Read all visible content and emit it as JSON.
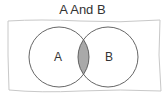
{
  "title": "A And B",
  "sets": [
    {
      "label": "A",
      "cx": 59,
      "cy": 57,
      "r": 30
    },
    {
      "label": "B",
      "cx": 108,
      "cy": 57,
      "r": 30
    }
  ],
  "intersection": {
    "label": "A and B",
    "fill": "#a9a9a9"
  },
  "colors": {
    "stroke": "#555555",
    "border": "#c8c8c8",
    "text": "#333333"
  }
}
